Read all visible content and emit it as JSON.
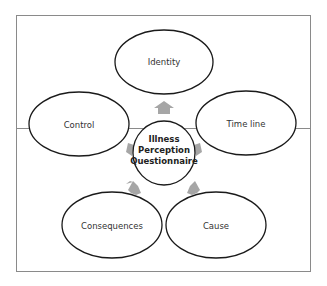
{
  "diagram": {
    "center": {
      "lines": [
        "Illness",
        "Perception",
        "Questionnaire"
      ]
    },
    "nodes": [
      {
        "id": "identity",
        "label": "Identity"
      },
      {
        "id": "timeline",
        "label": "Time line"
      },
      {
        "id": "cause",
        "label": "Cause"
      },
      {
        "id": "consequences",
        "label": "Consequences"
      },
      {
        "id": "control",
        "label": "Control"
      }
    ],
    "colors": {
      "frame": "#8a8a8a",
      "ellipse_stroke": "#1a1a1a",
      "arrow": "#a6a6a6",
      "text": "#333333"
    }
  }
}
